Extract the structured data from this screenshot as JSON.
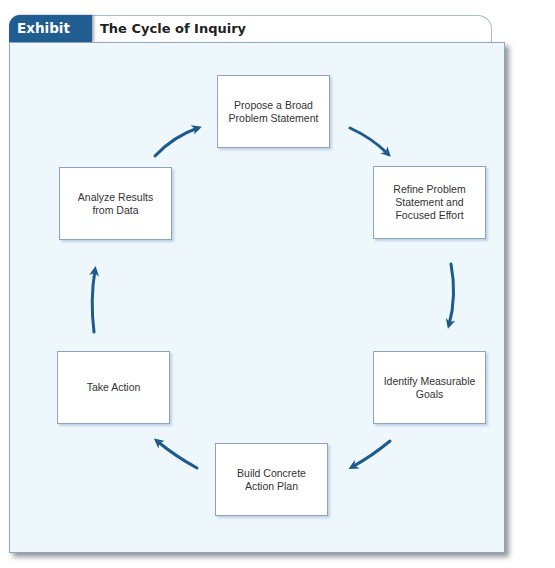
{
  "exhibit": {
    "label": "Exhibit 12.3",
    "title": "The Cycle of Inquiry"
  },
  "colors": {
    "tab_blue": "#1f5d92",
    "arrow_blue": "#1e5a8c",
    "panel_bg": "#edf7fc"
  },
  "cycle": {
    "steps": [
      {
        "label": "Propose a Broad Problem Statement"
      },
      {
        "label": "Refine Problem Statement and Focused Effort"
      },
      {
        "label": "Identify Measurable Goals"
      },
      {
        "label": "Build Concrete Action Plan"
      },
      {
        "label": "Take Action"
      },
      {
        "label": "Analyze Results from Data"
      }
    ],
    "direction": "clockwise"
  }
}
